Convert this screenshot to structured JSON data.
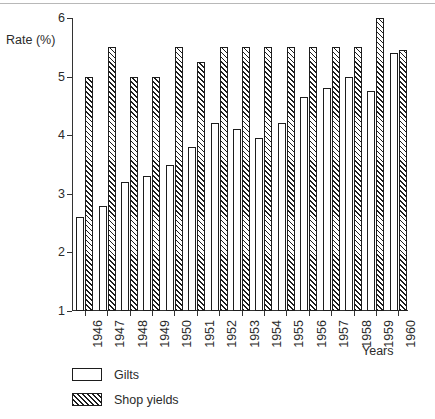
{
  "chart_data": {
    "type": "bar",
    "title": "",
    "xlabel": "Years",
    "ylabel": "Rate (%)",
    "ylim": [
      1,
      6
    ],
    "yticks": [
      1,
      2,
      3,
      4,
      5,
      6
    ],
    "ytick_labels": [
      "1",
      "2",
      "3",
      "4",
      "5",
      "6"
    ],
    "grid": false,
    "legend_position": "below-left",
    "categories": [
      "1946",
      "1947",
      "1948",
      "1949",
      "1950",
      "1951",
      "1952",
      "1953",
      "1954",
      "1955",
      "1956",
      "1957",
      "1958",
      "1959",
      "1960"
    ],
    "series": [
      {
        "name": "Gilts",
        "fill": "white",
        "values": [
          2.6,
          2.8,
          3.2,
          3.3,
          3.5,
          3.8,
          4.2,
          4.1,
          3.95,
          4.2,
          4.65,
          4.8,
          5.0,
          4.75,
          5.4
        ]
      },
      {
        "name": "Shop yields",
        "fill": "hatched",
        "values": [
          5.0,
          5.5,
          5.0,
          5.0,
          5.5,
          5.25,
          5.5,
          5.5,
          5.5,
          5.5,
          5.5,
          5.5,
          5.5,
          6.0,
          5.45
        ]
      }
    ]
  },
  "axis": {
    "y_title": "Rate (%)",
    "x_title": "Years"
  },
  "legend": {
    "items": [
      {
        "label": "Gilts",
        "fill": "white"
      },
      {
        "label": "Shop yields",
        "fill": "hatched"
      }
    ]
  },
  "colors": {
    "ink": "#1d1d1d",
    "text": "#2b2b2b",
    "background": "#ffffff",
    "rule": "#b8b8b8"
  }
}
